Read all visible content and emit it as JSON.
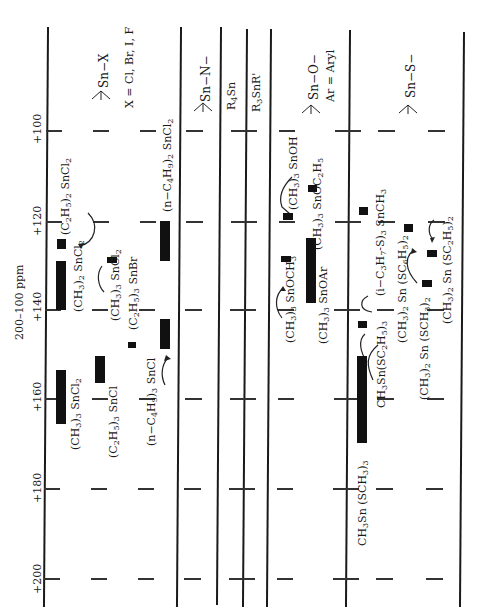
{
  "axis": {
    "unit_label": "200–100 ppm",
    "ticks": [
      "+100",
      "+120",
      "+140",
      "+160",
      "+180",
      "+200"
    ]
  },
  "columns": [
    {
      "id": "sn-x",
      "header": "Sn—X",
      "note": "X = Cl,  Br, I, F"
    },
    {
      "id": "sn-n",
      "header": "Sn—N—"
    },
    {
      "id": "r4sn",
      "header": "R4Sn"
    },
    {
      "id": "r3snr",
      "header": "R3SnR'"
    },
    {
      "id": "sn-o",
      "header": "Sn—O—",
      "note": "Ar = Aryl"
    },
    {
      "id": "sn-s",
      "header": "Sn—S—"
    }
  ],
  "compounds": {
    "et2sncl2": "(C2H5)2 SnCl2",
    "me2sncl2": "(CH3)2 SnCl2",
    "me3sncl2": "(CH3)3 SnCl2",
    "me3sncl2b": "(CH3)3 SnCl2",
    "et3snbr": "(C2H5)3 SnBr",
    "et3sncl": "(C2H5)3 SnCl",
    "bu2sncl2": "(n−C4H9)2 SnCl2",
    "bu3sncl": "(n−C4H9)3 SnCl",
    "me3snoh": "(CH3)3 SnOH",
    "me3snoet": "(CH3)3 SnOC2H5",
    "me3snome": "(CH3)3 SnOCH3",
    "me3snoar": "(CH3)3 SnOAr",
    "ipr_s": "(i−C3H7S)3 SnCH3",
    "me2sn_sph": "(CH3)2 Sn (SC6H5)2",
    "me2sn_set": "(CH3)2 Sn (SC2H5)2",
    "me2sn_sme": "(CH3)2 Sn (SCH3)2",
    "mesn_set": "CH3Sn(SC2H5)3",
    "mesn_sme": "CH3Sn (SCH3)3"
  },
  "chart_data": {
    "type": "range-diagram",
    "axis_label": "200–100 ppm",
    "axis_range": [
      100,
      200
    ],
    "ranges_ppm": [
      {
        "group": "Sn-X",
        "compound": "(CH3)3 SnCl2",
        "from": 152,
        "to": 165
      },
      {
        "group": "Sn-X",
        "compound": "(C2H5)2 SnCl2",
        "from": 125,
        "to": 128
      },
      {
        "group": "Sn-X",
        "compound": "(CH3)2 SnCl2",
        "from": 130,
        "to": 141
      },
      {
        "group": "Sn-X",
        "compound": "(CH3)3 SnCl2",
        "from": 128,
        "to": 130
      },
      {
        "group": "Sn-X",
        "compound": "(C2H5)3 SnBr",
        "from": 146,
        "to": 148
      },
      {
        "group": "Sn-X",
        "compound": "(C2H5)3 SnCl",
        "from": 150,
        "to": 156
      },
      {
        "group": "Sn-X",
        "compound": "(n-C4H9)2 SnCl2",
        "from": 120,
        "to": 129
      },
      {
        "group": "Sn-X",
        "compound": "(n-C4H9)3 SnCl",
        "from": 142,
        "to": 149
      },
      {
        "group": "Sn-O",
        "compound": "(CH3)3 SnOH",
        "from": 118,
        "to": 120
      },
      {
        "group": "Sn-O",
        "compound": "(CH3)3 SnOC2H5",
        "from": 111,
        "to": 113
      },
      {
        "group": "Sn-O",
        "compound": "(CH3)3 SnOCH3",
        "from": 128,
        "to": 130
      },
      {
        "group": "Sn-O",
        "compound": "(CH3)3 SnOAr",
        "from": 121,
        "to": 141
      },
      {
        "group": "Sn-S",
        "compound": "(i-C3H7S)3 SnCH3",
        "from": 116,
        "to": 118
      },
      {
        "group": "Sn-S",
        "compound": "(CH3)2 Sn (SC6H5)2",
        "from": 122,
        "to": 124
      },
      {
        "group": "Sn-S",
        "compound": "(CH3)2 Sn (SC2H5)2",
        "from": 127,
        "to": 129
      },
      {
        "group": "Sn-S",
        "compound": "(CH3)2 Sn (SCH3)2",
        "from": 133,
        "to": 135
      },
      {
        "group": "Sn-S",
        "compound": "CH3Sn(SC2H5)3",
        "from": 143,
        "to": 145
      },
      {
        "group": "Sn-S",
        "compound": "CH3Sn (SCH3)3",
        "from": 150,
        "to": 170
      }
    ]
  }
}
